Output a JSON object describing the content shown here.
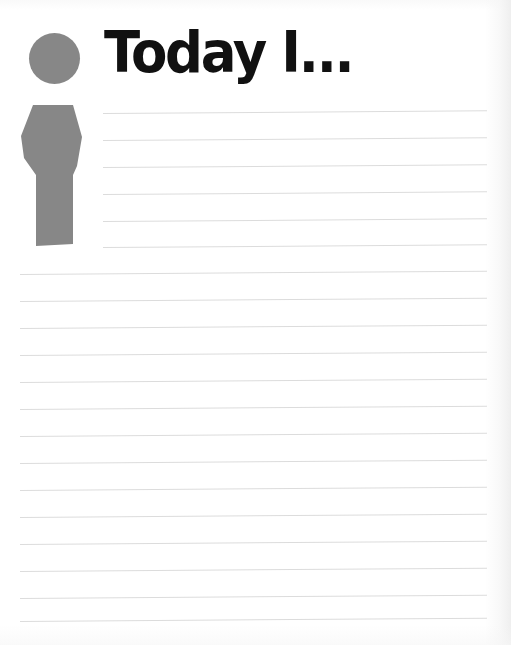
{
  "page": {
    "kind": "printable-journal-worksheet",
    "background_color": "#ffffff",
    "width": 511,
    "height": 645
  },
  "header": {
    "title": "Today I...",
    "title_color": "#111111",
    "icon": {
      "name": "person-pictogram",
      "color": "#878787",
      "description": "gray standing person silhouette"
    }
  },
  "writing_area": {
    "rule_color": "#dcdcdc",
    "line_spacing_px": 27,
    "short_lines": {
      "count": 6,
      "left": 103,
      "right": 487,
      "tops": [
        113,
        140,
        167,
        194,
        221,
        247
      ]
    },
    "full_lines": {
      "count": 13,
      "left": 20,
      "right": 487,
      "tops": [
        274,
        301,
        328,
        355,
        382,
        409,
        436,
        463,
        490,
        517,
        544,
        571,
        598,
        621
      ]
    }
  }
}
